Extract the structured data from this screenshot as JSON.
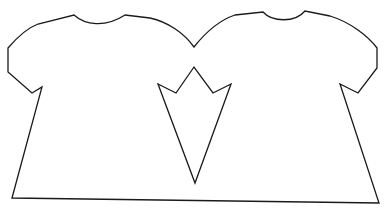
{
  "drawing": {
    "subject": "two joined shirts outline with crown-shaped cutout",
    "stroke_color": "#1a1a1a",
    "background_color": "#ffffff"
  }
}
